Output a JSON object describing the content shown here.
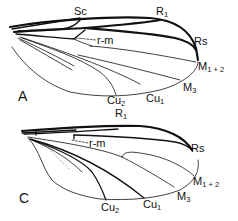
{
  "figure": {
    "type": "insect wing venation diagram",
    "panels": [
      {
        "id": "A",
        "panel_label": "A",
        "vein_labels": {
          "sc": "Sc",
          "r1": {
            "main": "R",
            "sub": "1"
          },
          "rs": "Rs",
          "rm": "r-m",
          "m12": {
            "main": "M",
            "sub": "1 + 2"
          },
          "m3": {
            "main": "M",
            "sub": "3"
          },
          "cu1": {
            "main": "Cu",
            "sub": "1"
          },
          "cu2": {
            "main": "Cu",
            "sub": "2"
          }
        }
      },
      {
        "id": "C",
        "panel_label": "C",
        "vein_labels": {
          "r1": {
            "main": "R",
            "sub": "1"
          },
          "rs": "Rs",
          "rm": "r-m",
          "m12": {
            "main": "M",
            "sub": "1 + 2"
          },
          "m3": {
            "main": "M",
            "sub": "3"
          },
          "cu1": {
            "main": "Cu",
            "sub": "1"
          },
          "cu2": {
            "main": "Cu",
            "sub": "2"
          }
        }
      }
    ],
    "colors": {
      "ink": "#111111",
      "faint": "#888888",
      "background": "#ffffff"
    }
  }
}
